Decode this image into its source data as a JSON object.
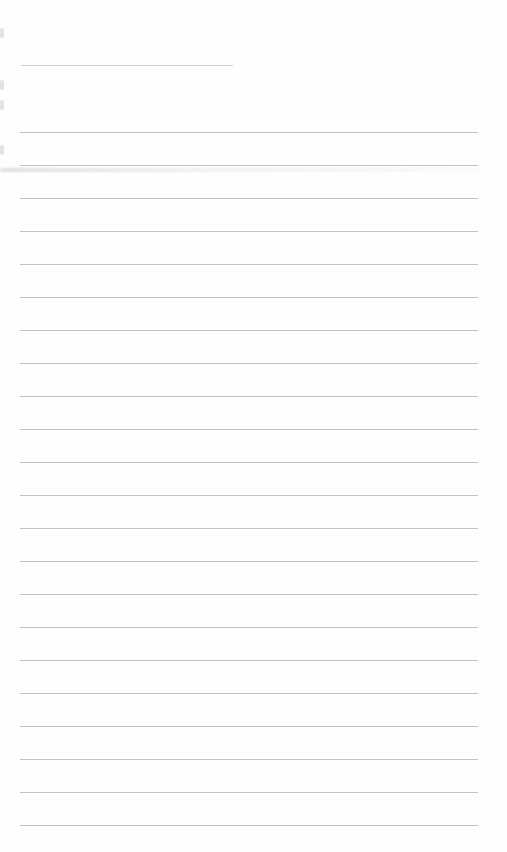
{
  "document": {
    "type": "lined-paper",
    "background_color": "#fefefe",
    "rule_color": "#b9b9b9",
    "header_rule": {
      "x": 21,
      "y": 65,
      "width": 212
    },
    "body_rules": {
      "x": 20,
      "width": 458,
      "start_y": 132,
      "spacing": 33,
      "count": 22
    },
    "text_content": []
  }
}
